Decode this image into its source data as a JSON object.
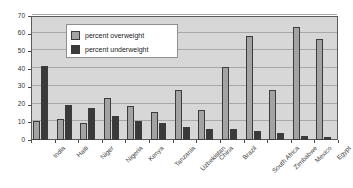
{
  "chart_data": {
    "type": "bar",
    "title": "",
    "subtitle": "",
    "xlabel": "",
    "ylabel": "",
    "ylim": [
      0,
      70
    ],
    "ytick_step": 10,
    "yticks": [
      0,
      10,
      20,
      30,
      40,
      50,
      60,
      70
    ],
    "grid": true,
    "legend_position": "upper-left-inside",
    "categories": [
      "India",
      "Haiti",
      "Niger",
      "Nigeria",
      "Kenya",
      "Tanzania",
      "Uzbekistan",
      "China",
      "Brazil",
      "South Africa",
      "Zimbabwe",
      "Mexico",
      "Egypt"
    ],
    "series": [
      {
        "name": "percent overweight",
        "color": "#a3a3a3",
        "values": [
          11,
          12,
          9.5,
          23.5,
          19,
          16,
          28.5,
          17,
          41,
          59,
          28,
          64,
          57
        ]
      },
      {
        "name": "percent underweight",
        "color": "#3a3a3a",
        "values": [
          42,
          19.5,
          18,
          13.5,
          11,
          9.5,
          7.5,
          6.5,
          6,
          5,
          4,
          2,
          1.5
        ]
      }
    ]
  },
  "legend": {
    "items": [
      {
        "label": "percent overweight",
        "swatch": "over"
      },
      {
        "label": "percent underweight",
        "swatch": "under"
      }
    ]
  },
  "colors": {
    "plot_background": "#d7d7d7",
    "gridline": "#a8a8a8",
    "axis": "#4a4a4a",
    "overweight_bar": "#a3a3a3",
    "underweight_bar": "#3a3a3a",
    "bar_border": "#3c3c3c",
    "legend_background": "#ffffff",
    "legend_border": "#8f8f8f",
    "page_background": "#ffffff"
  }
}
